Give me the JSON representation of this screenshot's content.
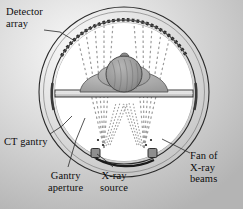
{
  "figure": {
    "background": "#ffffff",
    "ink": "#0d0d0d",
    "gantry_fill": "#c9c9c9",
    "gantry_light": "#efefef",
    "detector_color": "#2b2b2b",
    "beam_color": "#8d8d8d",
    "anatomy_fill": "#a6a6a6",
    "skull_fill": "#8f8f8f",
    "table_fill": "#d8d8d8"
  },
  "labels": {
    "detector_array": "Detector\narray",
    "ct_gantry": "CT gantry",
    "gantry_aperture": "Gantry\naperture",
    "xray_source": "X-ray\nsource",
    "fan_of_xray_beams": "Fan of\nX-ray\nbeams"
  },
  "parts": {
    "outer_ring_name": "ct-gantry-ring",
    "detector_arc_name": "detector-array-arc",
    "aperture_name": "gantry-aperture",
    "source_left_name": "xray-source-left",
    "source_right_name": "xray-source-right",
    "rotation_arrow_name": "gantry-rotation-arrow",
    "table_name": "patient-table",
    "head_name": "patient-head"
  },
  "geometry": {
    "center_x": 124,
    "center_y": 92,
    "outer_radius": 85,
    "inner_radius": 72,
    "detector_arc_degrees": 140,
    "rotation_direction": "clockwise"
  }
}
